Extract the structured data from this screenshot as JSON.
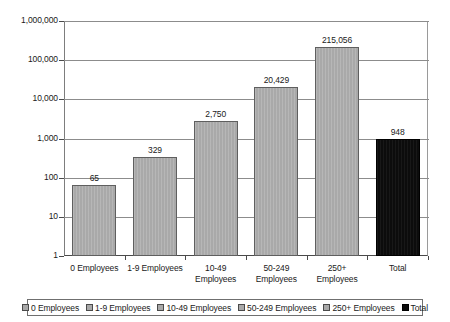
{
  "chart_data": {
    "type": "bar",
    "title": "",
    "xlabel": "",
    "ylabel": "",
    "scale": "log",
    "grid": true,
    "legend_position": "bottom",
    "ylim": [
      1,
      1000000
    ],
    "ytick_labels": [
      "1,000,000",
      "100,000",
      "10,000",
      "1,000",
      "100",
      "10",
      "1"
    ],
    "ytick_values": [
      1000000,
      100000,
      10000,
      1000,
      100,
      10,
      1
    ],
    "categories": [
      "0 Employees",
      "1-9 Employees",
      "10-49 Employees",
      "50-249 Employees",
      "250+ Employees",
      "Total"
    ],
    "category_label_lines": [
      [
        "0 Employees"
      ],
      [
        "1-9 Employees"
      ],
      [
        "10-49",
        "Employees"
      ],
      [
        "50-249",
        "Employees"
      ],
      [
        "250+",
        "Employees"
      ],
      [
        "Total"
      ]
    ],
    "values": [
      65,
      329,
      2750,
      20429,
      215056,
      948
    ],
    "value_labels": [
      "65",
      "329",
      "2,750",
      "20,429",
      "215,056",
      "948"
    ],
    "bar_colors": [
      "#a9a9a9",
      "#a9a9a9",
      "#a9a9a9",
      "#a9a9a9",
      "#a9a9a9",
      "#0c0c0c"
    ],
    "legend": [
      {
        "label": "0 Employees",
        "color": "#a9a9a9"
      },
      {
        "label": "1-9 Employees",
        "color": "#a9a9a9"
      },
      {
        "label": "10-49 Employees",
        "color": "#a9a9a9"
      },
      {
        "label": "50-249 Employees",
        "color": "#a9a9a9"
      },
      {
        "label": "250+ Employees",
        "color": "#a9a9a9"
      },
      {
        "label": "Total",
        "color": "#0c0c0c"
      }
    ]
  }
}
